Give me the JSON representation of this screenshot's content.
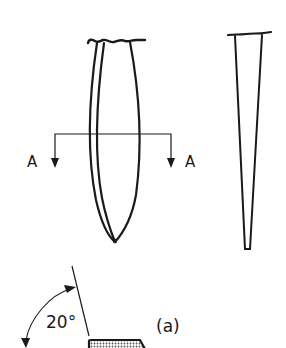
{
  "figure": {
    "section_labels": {
      "left": "A",
      "right": "A"
    },
    "angle_label": "20°",
    "subfigure_label": "(a)",
    "colors": {
      "ink": "#1a1a1a",
      "background": "#ffffff",
      "stipple": "#9a9a9a"
    }
  }
}
